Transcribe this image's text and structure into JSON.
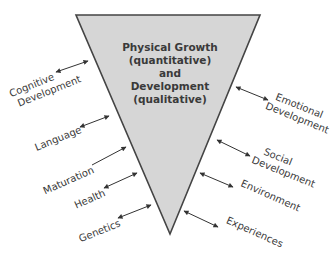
{
  "diagram": {
    "type": "inverted-triangle-influences",
    "colors": {
      "triangle_fill": "#d6d6d6",
      "triangle_stroke": "#444444",
      "text": "#3a3a3a",
      "arrow": "#333333"
    },
    "center": {
      "lines": [
        "Physical Growth",
        "(quantitative)",
        "and",
        "Development",
        "(qualitative)"
      ]
    },
    "left_factors": [
      {
        "label_lines": [
          "Cognitive",
          "Development"
        ],
        "arrow": "double"
      },
      {
        "label_lines": [
          "Language"
        ],
        "arrow": "double"
      },
      {
        "label_lines": [
          "Maturation"
        ],
        "arrow": "single-toward-triangle"
      },
      {
        "label_lines": [
          "Health"
        ],
        "arrow": "double"
      },
      {
        "label_lines": [
          "Genetics"
        ],
        "arrow": "double"
      }
    ],
    "right_factors": [
      {
        "label_lines": [
          "Emotional",
          "Development"
        ],
        "arrow": "double"
      },
      {
        "label_lines": [
          "Social",
          "Development"
        ],
        "arrow": "double"
      },
      {
        "label_lines": [
          "Environment"
        ],
        "arrow": "double"
      },
      {
        "label_lines": [
          "Experiences"
        ],
        "arrow": "double"
      }
    ]
  }
}
